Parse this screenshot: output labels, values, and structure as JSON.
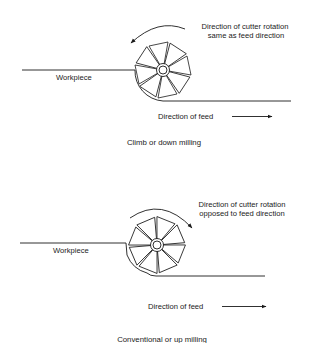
{
  "diagrams": [
    {
      "id": "climb",
      "caption": "Climb or down milling",
      "workpiece_label": "Workpiece",
      "rotation_note": [
        "Direction of cutter rotation",
        "same as feed direction"
      ],
      "feed_label": "Direction of feed",
      "rotation_arrow": "counterclockwise",
      "feed_arrow": "right"
    },
    {
      "id": "conventional",
      "caption": "Conventional or up milling",
      "workpiece_label": "Workpiece",
      "rotation_note": [
        "Direction of cutter rotation",
        "opposed to feed direction"
      ],
      "feed_label": "Direction of feed",
      "rotation_arrow": "clockwise",
      "feed_arrow": "right"
    }
  ],
  "colors": {
    "ink": "#1a1a1a",
    "background": "#ffffff"
  }
}
